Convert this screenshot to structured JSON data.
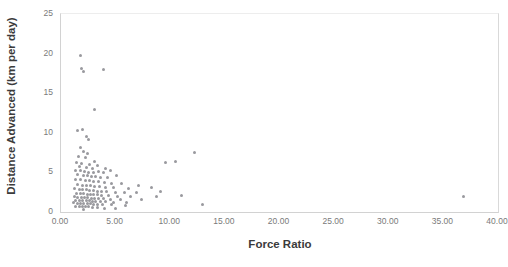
{
  "chart_data": {
    "type": "scatter",
    "title": "",
    "xlabel": "Force Ratio",
    "ylabel": "Distance Advanced (km per day)",
    "xlim": [
      0,
      40
    ],
    "ylim": [
      0,
      25
    ],
    "xticks": [
      "0.00",
      "5.00",
      "10.00",
      "15.00",
      "20.00",
      "25.00",
      "30.00",
      "35.00",
      "40.00"
    ],
    "xtick_values": [
      0,
      5,
      10,
      15,
      20,
      25,
      30,
      35,
      40
    ],
    "yticks": [
      "0",
      "5",
      "10",
      "15",
      "20",
      "25"
    ],
    "ytick_values": [
      0,
      5,
      10,
      15,
      20,
      25
    ],
    "grid": false,
    "legend": false,
    "marker_color": "#8e8e93",
    "marker_size_px": 3,
    "axis_color": "#d2d2d2",
    "label_color": "#3b3b3b",
    "tick_color": "#7a7a7a",
    "n_points": 131,
    "points": [
      [
        1.8,
        19.8
      ],
      [
        1.85,
        18.1
      ],
      [
        2.05,
        17.75
      ],
      [
        3.9,
        18.05
      ],
      [
        3.05,
        12.9
      ],
      [
        1.55,
        10.3
      ],
      [
        1.95,
        10.45
      ],
      [
        2.3,
        9.55
      ],
      [
        2.55,
        9.2
      ],
      [
        1.75,
        8.1
      ],
      [
        2.1,
        7.6
      ],
      [
        2.45,
        7.35
      ],
      [
        1.6,
        7.05
      ],
      [
        2.2,
        6.9
      ],
      [
        12.2,
        7.45
      ],
      [
        9.55,
        6.3
      ],
      [
        10.45,
        6.35
      ],
      [
        1.45,
        6.3
      ],
      [
        1.9,
        6.1
      ],
      [
        2.6,
        6.05
      ],
      [
        3.05,
        6.35
      ],
      [
        1.7,
        5.7
      ],
      [
        2.35,
        5.6
      ],
      [
        2.85,
        5.5
      ],
      [
        3.35,
        5.85
      ],
      [
        4.1,
        5.55
      ],
      [
        1.35,
        5.3
      ],
      [
        1.8,
        5.2
      ],
      [
        2.15,
        5.1
      ],
      [
        2.5,
        5.05
      ],
      [
        2.95,
        5.0
      ],
      [
        3.45,
        5.15
      ],
      [
        3.85,
        4.95
      ],
      [
        4.5,
        5.2
      ],
      [
        1.55,
        4.7
      ],
      [
        2.05,
        4.6
      ],
      [
        2.4,
        4.55
      ],
      [
        2.75,
        4.45
      ],
      [
        3.15,
        4.5
      ],
      [
        3.6,
        4.4
      ],
      [
        4.25,
        4.3
      ],
      [
        5.1,
        4.55
      ],
      [
        1.3,
        4.15
      ],
      [
        1.75,
        4.05
      ],
      [
        2.2,
        4.0
      ],
      [
        2.6,
        3.95
      ],
      [
        3.0,
        3.85
      ],
      [
        3.4,
        3.9
      ],
      [
        3.95,
        3.75
      ],
      [
        4.65,
        3.65
      ],
      [
        5.55,
        3.55
      ],
      [
        1.5,
        3.45
      ],
      [
        1.95,
        3.4
      ],
      [
        2.3,
        3.35
      ],
      [
        2.7,
        3.3
      ],
      [
        3.1,
        3.25
      ],
      [
        3.55,
        3.2
      ],
      [
        4.05,
        3.15
      ],
      [
        4.8,
        3.1
      ],
      [
        6.2,
        3.0
      ],
      [
        7.1,
        3.35
      ],
      [
        8.3,
        3.05
      ],
      [
        1.25,
        2.95
      ],
      [
        1.65,
        2.9
      ],
      [
        2.0,
        2.85
      ],
      [
        2.35,
        2.8
      ],
      [
        2.65,
        2.75
      ],
      [
        2.95,
        2.7
      ],
      [
        3.3,
        2.65
      ],
      [
        3.7,
        2.6
      ],
      [
        4.2,
        2.55
      ],
      [
        4.95,
        2.5
      ],
      [
        5.8,
        2.45
      ],
      [
        6.9,
        2.4
      ],
      [
        9.1,
        2.55
      ],
      [
        1.4,
        2.35
      ],
      [
        1.8,
        2.3
      ],
      [
        2.1,
        2.28
      ],
      [
        2.4,
        2.25
      ],
      [
        2.7,
        2.2
      ],
      [
        3.0,
        2.18
      ],
      [
        3.35,
        2.15
      ],
      [
        3.75,
        2.1
      ],
      [
        4.35,
        2.05
      ],
      [
        5.2,
        2.0
      ],
      [
        6.4,
        1.98
      ],
      [
        8.7,
        1.95
      ],
      [
        11.05,
        2.1
      ],
      [
        1.2,
        1.9
      ],
      [
        1.55,
        1.88
      ],
      [
        1.85,
        1.85
      ],
      [
        2.15,
        1.8
      ],
      [
        2.45,
        1.78
      ],
      [
        2.75,
        1.75
      ],
      [
        3.05,
        1.72
      ],
      [
        3.4,
        1.7
      ],
      [
        3.85,
        1.65
      ],
      [
        4.5,
        1.6
      ],
      [
        5.45,
        1.58
      ],
      [
        7.4,
        1.55
      ],
      [
        1.35,
        1.5
      ],
      [
        1.7,
        1.48
      ],
      [
        2.0,
        1.45
      ],
      [
        2.3,
        1.42
      ],
      [
        2.6,
        1.4
      ],
      [
        2.9,
        1.38
      ],
      [
        3.2,
        1.35
      ],
      [
        3.6,
        1.32
      ],
      [
        4.1,
        1.3
      ],
      [
        4.85,
        1.25
      ],
      [
        6.0,
        1.22
      ],
      [
        1.15,
        1.15
      ],
      [
        1.5,
        1.12
      ],
      [
        1.8,
        1.1
      ],
      [
        2.1,
        1.08
      ],
      [
        2.4,
        1.05
      ],
      [
        2.7,
        1.02
      ],
      [
        3.0,
        1.0
      ],
      [
        3.35,
        0.98
      ],
      [
        3.8,
        0.95
      ],
      [
        4.6,
        0.9
      ],
      [
        5.9,
        0.88
      ],
      [
        1.3,
        0.75
      ],
      [
        1.65,
        0.72
      ],
      [
        1.95,
        0.7
      ],
      [
        2.25,
        0.68
      ],
      [
        2.55,
        0.65
      ],
      [
        2.9,
        0.6
      ],
      [
        3.3,
        0.55
      ],
      [
        3.95,
        0.5
      ],
      [
        4.95,
        0.45
      ],
      [
        2.05,
        0.3
      ],
      [
        12.95,
        0.9
      ],
      [
        36.8,
        1.95
      ]
    ]
  }
}
